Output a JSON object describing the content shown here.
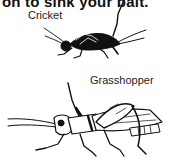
{
  "caption": {
    "top_text": "on to sink your bait."
  },
  "illustration": {
    "labels": {
      "cricket": "Cricket",
      "grasshopper": "Grasshopper"
    },
    "ink_color": "#111111",
    "background": "#ffffff"
  }
}
